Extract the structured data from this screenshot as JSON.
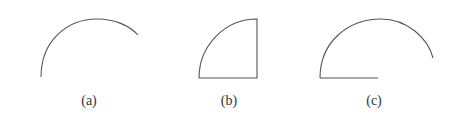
{
  "figure": {
    "stroke_color": "#555555",
    "label_color": "#333333",
    "panels": [
      {
        "id": "a",
        "label": "(a)",
        "shape": "open circular arc",
        "description": "Arc of a circle, open (no chords or radii)"
      },
      {
        "id": "b",
        "label": "(b)",
        "shape": "quarter circle sector",
        "description": "Quarter-circle arc closed by a vertical radius and a horizontal radius"
      },
      {
        "id": "c",
        "label": "(c)",
        "shape": "arc with one radius",
        "description": "Large circular arc with a horizontal segment from its left end"
      }
    ]
  }
}
